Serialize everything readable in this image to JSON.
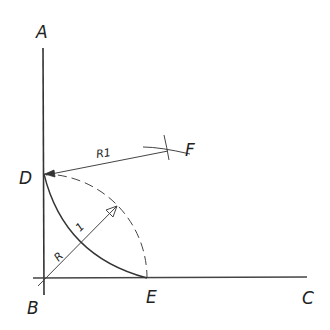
{
  "diagram": {
    "type": "geometric-construction",
    "colors": {
      "ink": "#333333",
      "background": "#ffffff"
    },
    "points": {
      "A": {
        "label": "A"
      },
      "B": {
        "label": "B"
      },
      "C": {
        "label": "C"
      },
      "D": {
        "label": "D"
      },
      "E": {
        "label": "E"
      },
      "F": {
        "label": "F"
      }
    },
    "dimensions": {
      "radius_main": "R",
      "radius_main_suffix": "1",
      "radius_r1": "R1"
    },
    "elements": [
      {
        "id": "line-AB",
        "kind": "line",
        "style": "solid",
        "from": "A",
        "to": "B"
      },
      {
        "id": "line-BC",
        "kind": "line",
        "style": "solid",
        "from": "B",
        "to": "C"
      },
      {
        "id": "radius-R",
        "kind": "dimension-arrow",
        "from": "B",
        "label": "R 1"
      },
      {
        "id": "arc-dashed",
        "kind": "arc",
        "style": "dashed",
        "center": "B",
        "from": "D",
        "to": "E"
      },
      {
        "id": "arc-solid",
        "kind": "arc",
        "style": "solid",
        "from": "D",
        "to": "E"
      },
      {
        "id": "radius-R1",
        "kind": "dimension-arrow",
        "from": "F",
        "to": "D",
        "label": "R1"
      },
      {
        "id": "intersection-F",
        "kind": "arc-intersection",
        "at": "F"
      }
    ]
  }
}
